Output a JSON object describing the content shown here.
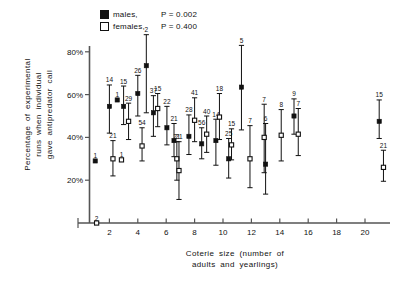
{
  "legend": {
    "males": {
      "label": "males,",
      "p": "P = 0.002",
      "marker": "filled-square-icon"
    },
    "females": {
      "label": "females,",
      "p": "P = 0.400",
      "marker": "open-square-icon"
    }
  },
  "axes": {
    "ytitle_line1": "Percentage  of  experimental",
    "ytitle_line2": "runs  when  individual",
    "ytitle_line3": "gave  antipredator  call",
    "xtitle_line1": "Coterie  size  (number  of",
    "xtitle_line2": "adults  and  yearlings)",
    "yticks": [
      "20%",
      "40%",
      "60%",
      "80%"
    ],
    "xticks": [
      "2",
      "4",
      "6",
      "8",
      "10",
      "12",
      "14",
      "16",
      "18",
      "20"
    ]
  },
  "chart_data": {
    "type": "scatter",
    "title": "",
    "xlabel": "Coterie size (number of adults and yearlings)",
    "ylabel": "Percentage of experimental runs when individual gave antipredator call",
    "xlim": [
      0,
      21.8
    ],
    "ylim": [
      0,
      88
    ],
    "yticks": [
      20,
      40,
      60,
      80
    ],
    "ytick_labels": [
      "20%",
      "40%",
      "60%",
      "80%"
    ],
    "xticks": [
      2,
      4,
      6,
      8,
      10,
      12,
      14,
      16,
      18,
      20
    ],
    "grid": false,
    "legend_position": "top-left",
    "error_bars": "vertical, capped (SE)",
    "point_labels": "sample size n shown above each point",
    "series": [
      {
        "name": "males",
        "marker": "filled-square",
        "color": "#111111",
        "p_value": 0.002,
        "points": [
          {
            "x": 1.0,
            "y": 29.0,
            "lo": 29.0,
            "hi": 29.0,
            "n": 1
          },
          {
            "x": 2.0,
            "y": 54.5,
            "lo": 42.0,
            "hi": 64.5,
            "n": 14
          },
          {
            "x": 2.55,
            "y": 57.5,
            "lo": 57.5,
            "hi": 57.5,
            "n": 1
          },
          {
            "x": 3.0,
            "y": 54.5,
            "lo": 46.0,
            "hi": 64.0,
            "n": 15
          },
          {
            "x": 4.0,
            "y": 60.5,
            "lo": 50.0,
            "hi": 69.0,
            "n": 26
          },
          {
            "x": 4.6,
            "y": 73.5,
            "lo": 51.5,
            "hi": 88.0,
            "n": 2
          },
          {
            "x": 5.1,
            "y": 51.5,
            "lo": 40.5,
            "hi": 59.5,
            "n": 37
          },
          {
            "x": 6.05,
            "y": 44.5,
            "lo": 36.5,
            "hi": 54.5,
            "n": 22
          },
          {
            "x": 6.55,
            "y": 38.5,
            "lo": 31.0,
            "hi": 46.5,
            "n": 21
          },
          {
            "x": 7.6,
            "y": 40.5,
            "lo": 32.0,
            "hi": 50.5,
            "n": 28
          },
          {
            "x": 8.5,
            "y": 37.0,
            "lo": 30.0,
            "hi": 44.5,
            "n": 56
          },
          {
            "x": 9.5,
            "y": 38.5,
            "lo": 27.0,
            "hi": 48.5,
            "n": 14
          },
          {
            "x": 10.4,
            "y": 30.0,
            "lo": 21.0,
            "hi": 39.5,
            "n": 25
          },
          {
            "x": 11.3,
            "y": 63.5,
            "lo": 43.5,
            "hi": 83.0,
            "n": 5
          },
          {
            "x": 13.0,
            "y": 27.5,
            "lo": 13.5,
            "hi": 46.5,
            "n": 6
          },
          {
            "x": 15.0,
            "y": 50.0,
            "lo": 41.5,
            "hi": 58.0,
            "n": 9
          },
          {
            "x": 21.0,
            "y": 47.5,
            "lo": 39.5,
            "hi": 57.5,
            "n": 15
          }
        ]
      },
      {
        "name": "females",
        "marker": "open-square",
        "color": "#ffffff",
        "p_value": 0.4,
        "points": [
          {
            "x": 1.1,
            "y": 0.0,
            "lo": 0.0,
            "hi": 0.0,
            "n": 2
          },
          {
            "x": 2.25,
            "y": 30.0,
            "lo": 22.0,
            "hi": 38.5,
            "n": 21
          },
          {
            "x": 2.85,
            "y": 29.5,
            "lo": 29.5,
            "hi": 29.5,
            "n": 1
          },
          {
            "x": 3.35,
            "y": 47.5,
            "lo": 39.0,
            "hi": 56.0,
            "n": 29
          },
          {
            "x": 4.3,
            "y": 36.0,
            "lo": 29.0,
            "hi": 44.5,
            "n": 54
          },
          {
            "x": 5.4,
            "y": 53.5,
            "lo": 45.0,
            "hi": 60.5,
            "n": 15
          },
          {
            "x": 6.75,
            "y": 30.0,
            "lo": 20.0,
            "hi": 38.0,
            "n": 21
          },
          {
            "x": 6.9,
            "y": 24.5,
            "lo": 11.0,
            "hi": 38.0,
            "n": 21
          },
          {
            "x": 8.0,
            "y": 48.0,
            "lo": 38.0,
            "hi": 58.5,
            "n": 41
          },
          {
            "x": 8.85,
            "y": 41.5,
            "lo": 33.0,
            "hi": 50.0,
            "n": 40
          },
          {
            "x": 9.75,
            "y": 49.5,
            "lo": 39.0,
            "hi": 60.5,
            "n": 18
          },
          {
            "x": 10.6,
            "y": 36.5,
            "lo": 29.5,
            "hi": 44.0,
            "n": 15
          },
          {
            "x": 11.9,
            "y": 30.0,
            "lo": 16.5,
            "hi": 45.5,
            "n": 7
          },
          {
            "x": 12.9,
            "y": 40.0,
            "lo": 23.5,
            "hi": 55.5,
            "n": 7
          },
          {
            "x": 14.1,
            "y": 41.0,
            "lo": 29.0,
            "hi": 53.0,
            "n": 8
          },
          {
            "x": 15.3,
            "y": 41.5,
            "lo": 31.5,
            "hi": 53.5,
            "n": 7
          },
          {
            "x": 21.3,
            "y": 26.0,
            "lo": 19.5,
            "hi": 34.0,
            "n": 21
          }
        ]
      }
    ]
  }
}
